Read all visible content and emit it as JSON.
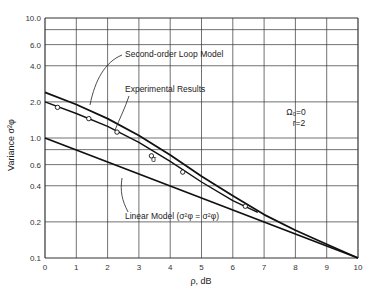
{
  "chart_data": {
    "type": "line",
    "title": "",
    "xlabel": "ρ, dB",
    "ylabel": "Variance σ²φ",
    "xlim": [
      0,
      10
    ],
    "ylim": [
      0.1,
      10.0
    ],
    "yscale": "log",
    "grid": true,
    "x_ticks": [
      "0",
      "1",
      "2",
      "3",
      "4",
      "5",
      "6",
      "7",
      "8",
      "9",
      "10"
    ],
    "y_ticks": [
      {
        "value": 10.0,
        "label": "10.0"
      },
      {
        "value": 8.0,
        "label": ""
      },
      {
        "value": 6.0,
        "label": "6.0"
      },
      {
        "value": 4.0,
        "label": "4.0"
      },
      {
        "value": 2.0,
        "label": "2.0"
      },
      {
        "value": 1.0,
        "label": "1.0"
      },
      {
        "value": 0.8,
        "label": ""
      },
      {
        "value": 0.6,
        "label": "0.6"
      },
      {
        "value": 0.4,
        "label": "0.4"
      },
      {
        "value": 0.2,
        "label": "0.2"
      },
      {
        "value": 0.1,
        "label": "0.1"
      }
    ],
    "annotation": {
      "line1": "Ω₀=0",
      "line2": "r=2"
    },
    "series": [
      {
        "name": "Second-order Loop Model",
        "style": "thick",
        "x": [
          0,
          1,
          2,
          3,
          4,
          5,
          6,
          7,
          8,
          9,
          10
        ],
        "y": [
          2.4,
          1.9,
          1.45,
          1.05,
          0.72,
          0.48,
          0.33,
          0.23,
          0.17,
          0.13,
          0.1
        ]
      },
      {
        "name": "Experimental Results",
        "style": "thin-with-markers",
        "x": [
          0,
          1,
          2,
          3,
          4,
          5,
          6,
          6.8
        ],
        "y": [
          2.0,
          1.6,
          1.25,
          0.92,
          0.64,
          0.43,
          0.3,
          0.24
        ],
        "markers": {
          "x": [
            0.4,
            1.4,
            2.3,
            3.4,
            4.4,
            6.4
          ],
          "y": [
            1.8,
            1.45,
            1.12,
            0.71,
            0.52,
            0.27
          ]
        }
      },
      {
        "name": "Linear Model (σ²φ = σ²φ)",
        "style": "thick",
        "x": [
          0,
          10
        ],
        "y": [
          1.0,
          0.1
        ]
      }
    ],
    "labels": {
      "second_order": "Second-order Loop Model",
      "experimental": "Experimental Results",
      "linear": "Linear Model (σ²φ = σ²φ)"
    }
  }
}
